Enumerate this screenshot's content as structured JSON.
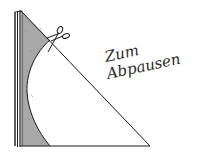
{
  "diagram": {
    "type": "folded-paper-cutting-template",
    "annotation": {
      "line1": "Zum",
      "line2": "Abpausen"
    },
    "elements": {
      "scissors": "scissors-icon",
      "folded_edge": "left fold (multiple paper layers)",
      "cut_region": "shaded concave cutout",
      "triangle": "right triangle outline"
    },
    "colors": {
      "ink": "#1a1a1a",
      "shade": "#a8a8a8",
      "paper": "#ffffff"
    }
  }
}
